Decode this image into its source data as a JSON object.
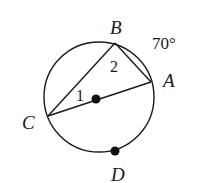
{
  "diagram": {
    "type": "circle-geometry",
    "circle": {
      "cx": 99,
      "cy": 97,
      "r": 55,
      "stroke": "#1a1a1a"
    },
    "center_dot": {
      "x": 96,
      "y": 98
    },
    "points": {
      "A": {
        "x": 151,
        "y": 82,
        "label": "A",
        "lx": 163,
        "ly": 86
      },
      "B": {
        "x": 115,
        "y": 43,
        "label": "B",
        "lx": 111,
        "ly": 33
      },
      "C": {
        "x": 48,
        "y": 116,
        "label": "C",
        "lx": 23,
        "ly": 128
      },
      "D": {
        "x": 115,
        "y": 151,
        "label": "D",
        "lx": 112,
        "ly": 180
      }
    },
    "segments": [
      {
        "from": "C",
        "to": "B"
      },
      {
        "from": "B",
        "to": "A"
      },
      {
        "from": "C",
        "to": "A"
      }
    ],
    "arc_label": {
      "text": "70°",
      "x": 152,
      "y": 48
    },
    "angle_labels": [
      {
        "text": "1",
        "x": 77,
        "y": 101
      },
      {
        "text": "2",
        "x": 111,
        "y": 71
      }
    ]
  }
}
